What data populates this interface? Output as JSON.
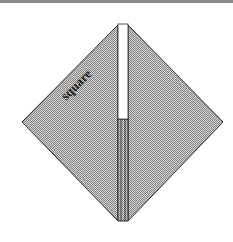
{
  "diagram": {
    "label": "square",
    "colors": {
      "fill": "#b4b4b4",
      "outline": "#2a2a2a",
      "slit": "#ffffff",
      "topbar": "#8a8a8a"
    }
  }
}
